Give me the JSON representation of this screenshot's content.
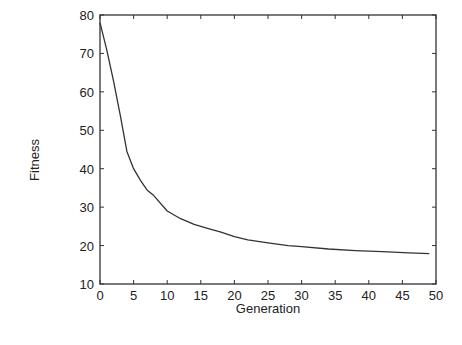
{
  "chart_data": {
    "type": "line",
    "title": "",
    "xlabel": "Generation",
    "ylabel": "Fitness",
    "xlim": [
      0,
      50
    ],
    "ylim": [
      10,
      80
    ],
    "xticks": [
      0,
      5,
      10,
      15,
      20,
      25,
      30,
      35,
      40,
      45,
      50
    ],
    "yticks": [
      10,
      20,
      30,
      40,
      50,
      60,
      70,
      80
    ],
    "grid": false,
    "legend": null,
    "series": [
      {
        "name": "Fitness",
        "x": [
          0,
          1,
          2,
          3,
          4,
          5,
          6,
          7,
          8,
          10,
          12,
          14,
          16,
          18,
          20,
          22,
          25,
          28,
          30,
          34,
          38,
          42,
          46,
          49
        ],
        "values": [
          78,
          71,
          63,
          54,
          44.5,
          40,
          37,
          34.5,
          33,
          29,
          27,
          25.5,
          24.5,
          23.5,
          22.3,
          21.5,
          20.7,
          20,
          19.7,
          19.1,
          18.7,
          18.4,
          18.1,
          17.9
        ]
      }
    ]
  }
}
